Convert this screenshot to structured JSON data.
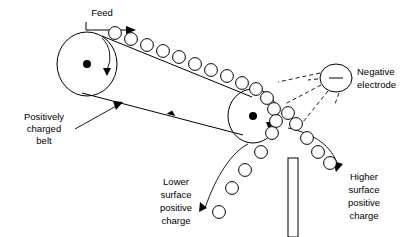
{
  "diagram": {
    "background_color": "#ffffff",
    "line_color": "#000000",
    "labels": {
      "feed": "Feed",
      "positively_charged_belt": [
        "Positively",
        "charged",
        "belt"
      ],
      "negative_electrode": [
        "Negative",
        "electrode"
      ],
      "lower_surface_positive_charge": [
        "Lower",
        "surface",
        "positive",
        "charge"
      ],
      "higher_surface_positive_charge": [
        "Higher",
        "surface",
        "positive",
        "charge"
      ]
    },
    "symbols": {
      "electrode_charge_sign": "−",
      "pulley_axis_marker": "dot",
      "rotation_direction": "clockwise"
    },
    "components": [
      "left-pulley",
      "right-pulley",
      "conveyor-belt",
      "feed-arrow",
      "particle-row-on-belt",
      "negative-electrode",
      "electrode-field-rays",
      "splitter-plate",
      "lower-surface-particle-stream",
      "higher-surface-particle-stream"
    ]
  }
}
